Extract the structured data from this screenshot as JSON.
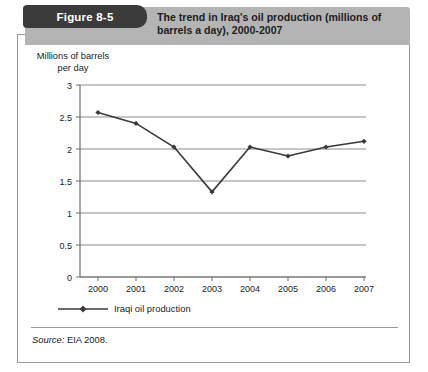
{
  "figure": {
    "badge_label": "Figure 8-5",
    "title": "The trend in Iraq's oil production (millions of barrels a day), 2000-2007",
    "source_label": "Source:",
    "source_text": "EIA 2008."
  },
  "colors": {
    "badge_background": "#3b3b3b",
    "header_band": "#b4b4b4",
    "series_line": "#3a3a3a",
    "gridline": "#8c8c8c",
    "axis": "#6e6e6e",
    "card_border": "#9b9b9b",
    "text": "#1d1d1d"
  },
  "chart_data": {
    "type": "line",
    "title": "The trend in Iraq's oil production (millions of barrels a day), 2000-2007",
    "xlabel": "",
    "ylabel": "Millions of barrels per day",
    "categories": [
      "2000",
      "2001",
      "2002",
      "2003",
      "2004",
      "2005",
      "2006",
      "2007"
    ],
    "x": [
      2000,
      2001,
      2002,
      2003,
      2004,
      2005,
      2006,
      2007
    ],
    "values": [
      2.57,
      2.4,
      2.03,
      1.33,
      2.03,
      1.89,
      2.03,
      2.12
    ],
    "series": [
      {
        "name": "Iraqi oil production",
        "values": [
          2.57,
          2.4,
          2.03,
          1.33,
          2.03,
          1.89,
          2.03,
          2.12
        ]
      }
    ],
    "ylim": [
      0,
      3
    ],
    "yticks": [
      0,
      0.5,
      1,
      1.5,
      2,
      2.5,
      3
    ],
    "ytick_labels": [
      "0",
      "0.5",
      "1",
      "1.5",
      "2",
      "2.5",
      "3"
    ],
    "xtick_labels": [
      "2000",
      "2001",
      "2002",
      "2003",
      "2004",
      "2005",
      "2006",
      "2007"
    ],
    "grid": true,
    "legend": [
      "Iraqi oil production"
    ],
    "legend_position": "below-left",
    "marker": "diamond"
  }
}
